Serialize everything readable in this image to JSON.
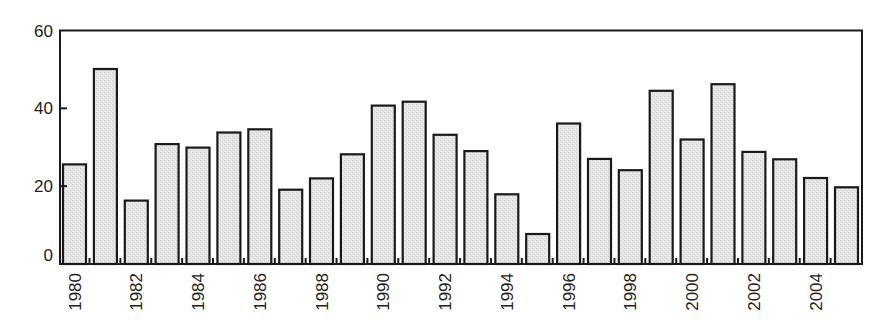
{
  "chart_data": {
    "type": "bar",
    "title": "",
    "xlabel": "",
    "ylabel": "",
    "ylim": [
      0,
      60
    ],
    "yticks": [
      0,
      20,
      40,
      60
    ],
    "grid": false,
    "legend": null,
    "categories": [
      "1980",
      "1981",
      "1982",
      "1983",
      "1984",
      "1985",
      "1986",
      "1987",
      "1988",
      "1989",
      "1990",
      "1991",
      "1992",
      "1993",
      "1994",
      "1995",
      "1996",
      "1997",
      "1998",
      "1999",
      "2000",
      "2001",
      "2002",
      "2003",
      "2004",
      "2005"
    ],
    "xtick_labels": [
      "1980",
      "1982",
      "1984",
      "1986",
      "1988",
      "1990",
      "1992",
      "1994",
      "1996",
      "1998",
      "2000",
      "2002",
      "2004"
    ],
    "values": [
      25.6,
      50.1,
      16.3,
      30.8,
      29.9,
      33.8,
      34.6,
      19.1,
      22.0,
      28.2,
      40.7,
      41.7,
      33.2,
      29.0,
      17.9,
      7.7,
      36.1,
      27.0,
      24.1,
      44.5,
      32.0,
      46.2,
      28.8,
      26.9,
      22.1,
      19.7
    ],
    "colors": {
      "bar_fill": "#e3e3e3",
      "bar_stroke": "#1a1a1a",
      "axis": "#1a1a1a",
      "text": "#222222"
    }
  }
}
